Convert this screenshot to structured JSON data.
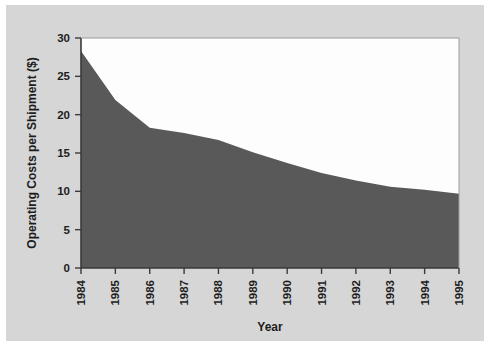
{
  "figure": {
    "background_color": "#ffffff",
    "plate_color": "#d6d6d6",
    "plot_background_color": "#fdfdfd",
    "area_color": "#595959",
    "axis_color": "#3a3a3a"
  },
  "chart_data": {
    "type": "area",
    "title": "",
    "xlabel": "Year",
    "ylabel": "Operating Costs per Shipment ($)",
    "categories": [
      "1984",
      "1985",
      "1986",
      "1987",
      "1988",
      "1989",
      "1990",
      "1991",
      "1992",
      "1993",
      "1994",
      "1995"
    ],
    "x": [
      1984,
      1985,
      1986,
      1987,
      1988,
      1989,
      1990,
      1991,
      1992,
      1993,
      1994,
      1995
    ],
    "values": [
      28.3,
      21.9,
      18.3,
      17.6,
      16.7,
      15.1,
      13.7,
      12.4,
      11.4,
      10.6,
      10.2,
      9.7
    ],
    "series": [
      {
        "name": "Operating Costs per Shipment",
        "values": [
          28.3,
          21.9,
          18.3,
          17.6,
          16.7,
          15.1,
          13.7,
          12.4,
          11.4,
          10.6,
          10.2,
          9.7
        ]
      }
    ],
    "ylim": [
      0,
      30
    ],
    "xlim": [
      1984,
      1995
    ],
    "yticks": [
      0,
      5,
      10,
      15,
      20,
      25,
      30
    ],
    "ytick_labels": [
      "0",
      "5",
      "10",
      "15",
      "20",
      "25",
      "30"
    ],
    "xtick_labels": [
      "1984",
      "1985",
      "1986",
      "1987",
      "1988",
      "1989",
      "1990",
      "1991",
      "1992",
      "1993",
      "1994",
      "1995"
    ],
    "xtick_rotation": 90,
    "grid": false,
    "legend": false,
    "legend_position": "none"
  }
}
